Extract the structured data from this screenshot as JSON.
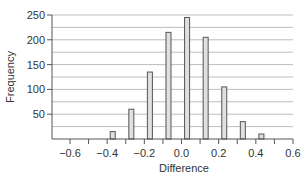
{
  "chart_data": {
    "type": "bar",
    "title": "",
    "xlabel": "Difference",
    "ylabel": "Frequency",
    "xlim": [
      -0.6,
      0.6
    ],
    "ylim": [
      0,
      250
    ],
    "grid": {
      "horizontal": true,
      "vertical": false,
      "step": 25
    },
    "x_ticks": [
      "−0.6",
      "−0.4",
      "−0.2",
      "0.0",
      "0.2",
      "0.4",
      "0.6"
    ],
    "x_tick_values": [
      -0.6,
      -0.4,
      -0.2,
      0.0,
      0.2,
      0.4,
      0.6
    ],
    "y_ticks": [
      "50",
      "100",
      "150",
      "200",
      "250"
    ],
    "y_tick_values": [
      50,
      100,
      150,
      200,
      250
    ],
    "x": [
      -0.37,
      -0.27,
      -0.17,
      -0.07,
      0.03,
      0.13,
      0.23,
      0.33,
      0.43
    ],
    "values": [
      15,
      60,
      135,
      215,
      245,
      205,
      105,
      35,
      10
    ],
    "legend": null,
    "colors": {
      "bar_fill": "#e0e0e0",
      "bar_stroke": "#555555",
      "grid": "#bdbdbd",
      "axis": "#555555"
    }
  }
}
